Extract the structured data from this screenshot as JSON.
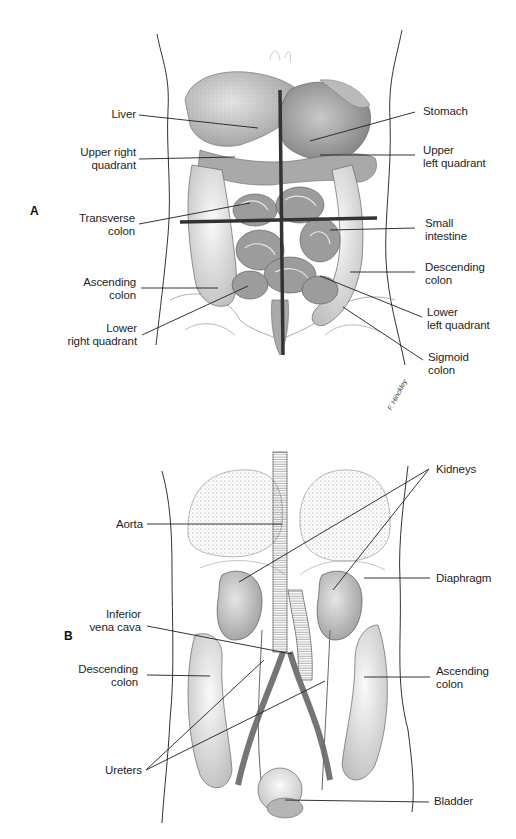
{
  "figure": {
    "panels": [
      {
        "id": "A",
        "letter": "A",
        "title_visible": false,
        "labels": {
          "liver": "Liver",
          "upper_right_quadrant": "Upper right\nquadrant",
          "transverse_colon": "Transverse\ncolon",
          "ascending_colon": "Ascending\ncolon",
          "lower_right_quadrant": "Lower\nright quadrant",
          "stomach": "Stomach",
          "upper_left_quadrant": "Upper\nleft quadrant",
          "small_intestine": "Small\nintestine",
          "descending_colon": "Descending\ncolon",
          "lower_left_quadrant": "Lower\nleft quadrant",
          "sigmoid_colon": "Sigmoid\ncolon"
        },
        "artist_signature": "F. Hinckley"
      },
      {
        "id": "B",
        "letter": "B",
        "labels": {
          "aorta": "Aorta",
          "inferior_vena_cava": "Inferior\nvena cava",
          "descending_colon": "Descending\ncolon",
          "ureters": "Ureters",
          "kidneys": "Kidneys",
          "diaphragm": "Diaphragm",
          "ascending_colon": "Ascending\ncolon",
          "bladder": "Bladder"
        }
      }
    ],
    "colors": {
      "background": "#ffffff",
      "ink": "#1e1e1e",
      "quadrant_lines": "#3a3a3a",
      "organ_shade": "#9a9a9a",
      "organ_light": "#d6d6d6"
    }
  }
}
